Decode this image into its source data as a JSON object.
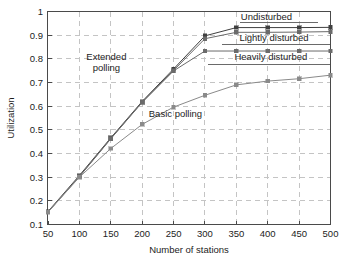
{
  "chart_data": {
    "type": "line",
    "title": "",
    "xlabel": "Number of stations",
    "ylabel": "Utilization",
    "xlim": [
      50,
      500
    ],
    "ylim": [
      0.1,
      1
    ],
    "grid": true,
    "legend_position": "inline-annotations",
    "xticks": [
      50,
      100,
      150,
      200,
      250,
      300,
      350,
      400,
      450,
      500
    ],
    "xtick_labels": [
      "50",
      "100",
      "150",
      "200",
      "250",
      "300",
      "350",
      "400",
      "450",
      "500"
    ],
    "yticks": [
      0.1,
      0.2,
      0.3,
      0.4,
      0.5,
      0.6,
      0.7,
      0.8,
      0.9,
      1
    ],
    "ytick_labels": [
      "0.1",
      "0.2",
      "0.3",
      "0.4",
      "0.5",
      "0.6",
      "0.7",
      "0.8",
      "0.9",
      "1"
    ],
    "x": [
      50,
      100,
      150,
      200,
      250,
      300,
      350,
      400,
      450,
      500
    ],
    "series": [
      {
        "name": "Undisturbed",
        "color": "#3f3f3f",
        "marker": "square",
        "values": [
          0.155,
          0.307,
          0.466,
          0.62,
          0.757,
          0.897,
          0.932,
          0.932,
          0.932,
          0.933
        ]
      },
      {
        "name": "Lightly disturbed",
        "color": "#6b6b6b",
        "marker": "square",
        "values": [
          0.153,
          0.303,
          0.463,
          0.617,
          0.751,
          0.885,
          0.912,
          0.912,
          0.913,
          0.915
        ]
      },
      {
        "name": "Heavily disturbed",
        "color": "#6b6b6b",
        "marker": "square",
        "values": [
          0.153,
          0.302,
          0.462,
          0.616,
          0.749,
          0.833,
          0.833,
          0.833,
          0.833,
          0.833
        ]
      },
      {
        "name": "Basic polling",
        "color": "#8a8a8a",
        "marker": "square",
        "values": [
          0.152,
          0.3,
          0.421,
          0.523,
          0.596,
          0.646,
          0.69,
          0.706,
          0.716,
          0.731
        ]
      }
    ],
    "annotations": [
      {
        "name": "extended-polling",
        "text_lines": [
          "Extended",
          "polling"
        ],
        "x": 143,
        "y": 0.795
      },
      {
        "name": "basic-polling",
        "text_lines": [
          "Basic polling"
        ],
        "x": 253,
        "y": 0.555
      },
      {
        "name": "undisturbed",
        "text_lines": [
          "Undisturbed"
        ],
        "x": 398,
        "y": 0.966
      },
      {
        "name": "lightly-disturbed",
        "text_lines": [
          "Lightly disturbed"
        ],
        "x": 410,
        "y": 0.876
      },
      {
        "name": "heavily-disturbed",
        "text_lines": [
          "Heavily disturbed"
        ],
        "x": 405,
        "y": 0.793
      }
    ]
  },
  "caption": {
    "ghost_line": ""
  }
}
